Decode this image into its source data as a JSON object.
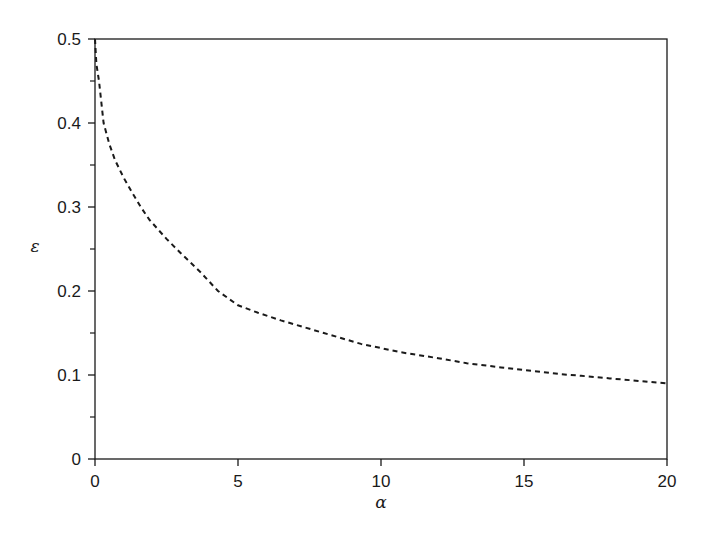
{
  "chart_data": {
    "type": "line",
    "title": "",
    "xlabel": "α",
    "ylabel": "ε",
    "xlim": [
      0,
      20
    ],
    "ylim": [
      0,
      0.5
    ],
    "xticks": [
      0,
      5,
      10,
      15,
      20
    ],
    "xtick_labels": [
      "0",
      "5",
      "10",
      "15",
      "20"
    ],
    "yticks": [
      0,
      0.1,
      0.2,
      0.3,
      0.4,
      0.5
    ],
    "ytick_labels": [
      "0",
      "0.1",
      "0.2",
      "0.3",
      "0.4",
      "0.5"
    ],
    "yminor_ticks": [
      0.05,
      0.15,
      0.25,
      0.35,
      0.45
    ],
    "grid": false,
    "legend": null,
    "series": [
      {
        "name": "ε(α)",
        "style": "dashed",
        "color": "#1a1a1a",
        "x": [
          0,
          0.05,
          0.14,
          0.3,
          0.5,
          0.7,
          1.0,
          1.3,
          1.6,
          1.9,
          2.5,
          3.0,
          3.7,
          4.3,
          5.0,
          5.7,
          6.5,
          7.2,
          8.0,
          9.3,
          10.0,
          10.7,
          12.0,
          13.0,
          14.2,
          15.0,
          16.3,
          17.0,
          18.0,
          19.0,
          20.0
        ],
        "y": [
          0.5,
          0.47,
          0.45,
          0.4,
          0.375,
          0.356,
          0.335,
          0.317,
          0.3,
          0.285,
          0.262,
          0.245,
          0.222,
          0.2,
          0.183,
          0.174,
          0.165,
          0.158,
          0.15,
          0.137,
          0.132,
          0.127,
          0.12,
          0.114,
          0.109,
          0.106,
          0.101,
          0.099,
          0.096,
          0.093,
          0.09
        ]
      }
    ]
  }
}
